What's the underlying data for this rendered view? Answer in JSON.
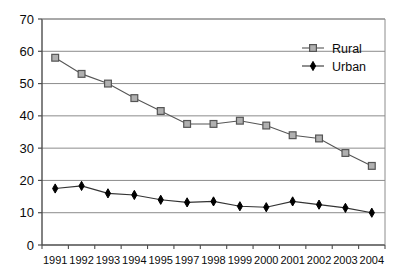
{
  "chart_data": {
    "type": "line",
    "title": "",
    "subtitle": "",
    "xlabel": "",
    "ylabel": "",
    "categories": [
      "1991",
      "1992",
      "1993",
      "1994",
      "1995",
      "1997",
      "1998",
      "1999",
      "2000",
      "2001",
      "2002",
      "2003",
      "2004"
    ],
    "ylim": [
      0,
      70
    ],
    "yticks": [
      0,
      10,
      20,
      30,
      40,
      50,
      60,
      70
    ],
    "ytick_labels": [
      "0",
      "10",
      "20",
      "30",
      "40",
      "50",
      "60",
      "70"
    ],
    "grid": "horizontal",
    "legend_position": "top-right",
    "series": [
      {
        "name": "Rural",
        "marker": "square",
        "marker_fill": "#b0b0b0",
        "marker_stroke": "#555555",
        "line_color": "#555555",
        "values": [
          58,
          53,
          50,
          45.5,
          41.5,
          37.5,
          37.5,
          38.5,
          37,
          34,
          33,
          28.5,
          24.5
        ]
      },
      {
        "name": "Urban",
        "marker": "diamond",
        "marker_fill": "#000000",
        "marker_stroke": "#000000",
        "line_color": "#333333",
        "values": [
          17.5,
          18.3,
          16,
          15.5,
          14,
          13.2,
          13.5,
          12,
          11.7,
          13.5,
          12.5,
          11.5,
          10
        ]
      }
    ]
  },
  "legend": {
    "items": [
      {
        "label": "Rural"
      },
      {
        "label": "Urban"
      }
    ]
  },
  "axes": {
    "y_axis_name": "value-axis",
    "x_axis_name": "category-axis"
  }
}
